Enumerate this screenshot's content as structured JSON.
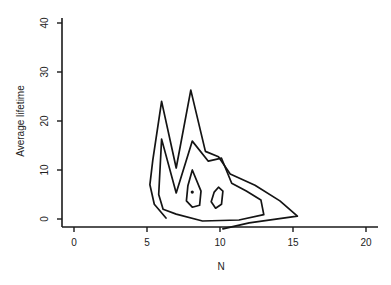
{
  "chart_data": {
    "type": "contour",
    "title": "",
    "xlabel": "N",
    "ylabel": "Average lifetime",
    "xlim": [
      -1,
      21
    ],
    "ylim": [
      -1,
      41
    ],
    "xticks": [
      0,
      5,
      10,
      15,
      20
    ],
    "yticks": [
      0,
      10,
      20,
      30,
      40
    ],
    "grid": false,
    "legend": null,
    "contours": [
      {
        "name": "outer",
        "points": [
          [
            6.3,
            0.2
          ],
          [
            5.5,
            3
          ],
          [
            5.2,
            7
          ],
          [
            5.4,
            12
          ],
          [
            6.0,
            24
          ],
          [
            7.0,
            10.4
          ],
          [
            8.0,
            26.3
          ],
          [
            9.0,
            13.8
          ],
          [
            9.9,
            12.7
          ],
          [
            10.7,
            9.2
          ],
          [
            12.4,
            6.9
          ],
          [
            14.1,
            3.7
          ],
          [
            15.3,
            0.6
          ],
          [
            12.0,
            -0.8
          ],
          [
            10.2,
            -2
          ]
        ]
      },
      {
        "name": "middle",
        "points": [
          [
            6.1,
            2
          ],
          [
            5.8,
            5
          ],
          [
            6.0,
            16.3
          ],
          [
            7.0,
            5.3
          ],
          [
            8.1,
            15.9
          ],
          [
            9.2,
            11.8
          ],
          [
            10.1,
            12.4
          ],
          [
            10.8,
            7.3
          ],
          [
            11.8,
            5.7
          ],
          [
            12.8,
            3.9
          ],
          [
            13.0,
            0.9
          ],
          [
            11.3,
            -0.2
          ],
          [
            8.8,
            -0.4
          ],
          [
            7.0,
            1.0
          ],
          [
            6.1,
            2
          ]
        ]
      },
      {
        "name": "inner-left",
        "points": [
          [
            8.1,
            10
          ],
          [
            8.7,
            5.7
          ],
          [
            8.6,
            2.8
          ],
          [
            8.1,
            2.4
          ],
          [
            7.7,
            3.7
          ],
          [
            7.8,
            6.8
          ],
          [
            8.1,
            10
          ]
        ]
      },
      {
        "name": "inner-right",
        "points": [
          [
            9.9,
            6.5
          ],
          [
            10.2,
            5.7
          ],
          [
            10.1,
            3
          ],
          [
            9.7,
            2.2
          ],
          [
            9.4,
            3.5
          ],
          [
            9.6,
            5.5
          ],
          [
            9.9,
            6.5
          ]
        ]
      }
    ],
    "peak_marker": [
      8.1,
      5.5
    ]
  }
}
